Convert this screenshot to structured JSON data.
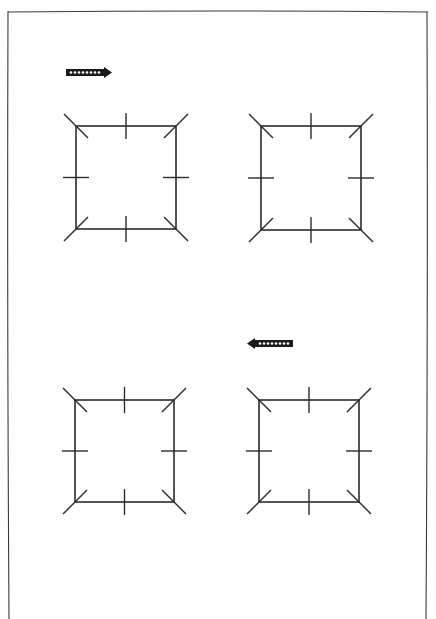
{
  "page": {
    "width": 436,
    "height": 619,
    "background": "#ffffff",
    "ink": "#2b2b2b"
  },
  "frame": {
    "left": 8,
    "top": 11,
    "right": 427,
    "bottom": 619
  },
  "arrows": [
    {
      "name": "arrow-right",
      "direction": "right",
      "x": 66,
      "y": 67,
      "width": 46,
      "height": 11,
      "dots": 8
    },
    {
      "name": "arrow-left",
      "direction": "left",
      "x": 247,
      "y": 338,
      "width": 46,
      "height": 11,
      "dots": 8
    }
  ],
  "squares": [
    {
      "name": "square-top-left",
      "x1": 76,
      "y1": 126,
      "x2": 176,
      "y2": 229
    },
    {
      "name": "square-top-right",
      "x1": 261,
      "y1": 126,
      "x2": 361,
      "y2": 230
    },
    {
      "name": "square-bottom-left",
      "x1": 75,
      "y1": 400,
      "x2": 174,
      "y2": 502
    },
    {
      "name": "square-bottom-right",
      "x1": 259,
      "y1": 400,
      "x2": 359,
      "y2": 502
    }
  ],
  "tick_length": 13,
  "corner_diag": 12
}
